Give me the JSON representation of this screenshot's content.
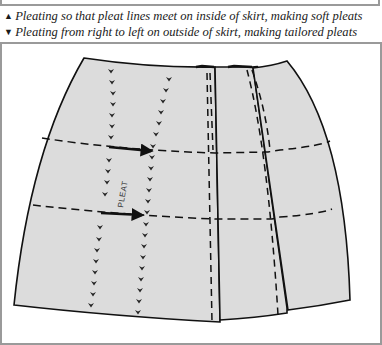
{
  "caption": {
    "lines": [
      {
        "marker": "▲",
        "marker_name": "triangle-up-icon",
        "text": "Pleating so that pleat lines meet on inside of skirt, making soft pleats"
      },
      {
        "marker": "▼",
        "marker_name": "triangle-down-icon",
        "text": "Pleating from right to left on outside of skirt, making tailored pleats"
      }
    ]
  },
  "diagram": {
    "label": "PLEAT",
    "colors": {
      "fabric": "#dcdcdc",
      "outline": "#111111",
      "frame": "#9a9a9a"
    }
  }
}
